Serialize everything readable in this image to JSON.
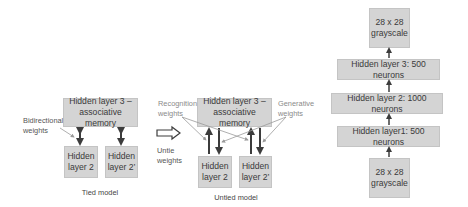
{
  "tied_model": {
    "caption": "Tied model",
    "top_box": {
      "line1": "Hidden layer 3 –",
      "line2": "associative memory"
    },
    "bottom_left": {
      "line1": "Hidden",
      "line2": "layer 2"
    },
    "bottom_right": {
      "line1": "Hidden",
      "line2": "layer 2’"
    },
    "annotation": {
      "line1": "Bidirectional",
      "line2": "weights"
    }
  },
  "untie_arrow": {
    "line1": "Untie",
    "line2": "weights"
  },
  "untied_model": {
    "caption": "Untied model",
    "top_box": {
      "line1": "Hidden layer 3 –",
      "line2": "associative memory"
    },
    "bottom_left": {
      "line1": "Hidden",
      "line2": "layer 2"
    },
    "bottom_right": {
      "line1": "Hidden",
      "line2": "layer 2’"
    },
    "recognition": {
      "line1": "Recognition",
      "line2": "weights"
    },
    "generative": {
      "line1": "Generative",
      "line2": "weights"
    }
  },
  "stack": {
    "top_output": {
      "line1": "28 x 28",
      "line2": "grayscale"
    },
    "layers": [
      "Hidden layer 3: 500 neurons",
      "Hidden layer 2: 1000 neurons",
      "Hidden layer1: 500 neurons"
    ],
    "bottom_input": {
      "line1": "28 x 28",
      "line2": "grayscale"
    }
  },
  "colors": {
    "box_fill": "#d4d4d4",
    "arrow": "#3c3c3c",
    "pointer": "#9a9a9a"
  }
}
